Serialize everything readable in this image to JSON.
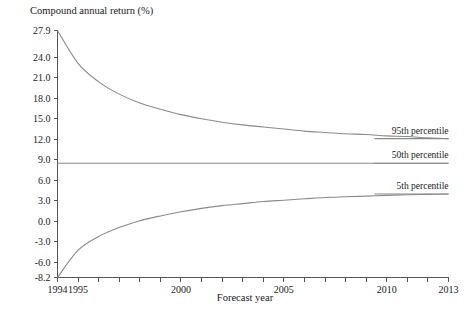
{
  "chart_data": {
    "type": "line",
    "title": "",
    "ylabel": "Compound annual return (%)",
    "xlabel": "Forecast year",
    "grid": false,
    "legend_position": "right-inline",
    "xlim": [
      1994,
      2013
    ],
    "ylim": [
      -8.2,
      27.9
    ],
    "x_tick_values": [
      1994,
      1995,
      1996,
      1997,
      1998,
      1999,
      2000,
      2001,
      2002,
      2003,
      2004,
      2005,
      2006,
      2007,
      2008,
      2009,
      2010,
      2011,
      2012,
      2013
    ],
    "x_tick_labels": [
      "1994",
      "1995",
      "",
      "",
      "",
      "",
      "2000",
      "",
      "",
      "",
      "",
      "2005",
      "",
      "",
      "",
      "",
      "2010",
      "",
      "",
      "2013"
    ],
    "y_tick_values": [
      27.9,
      24.0,
      21.0,
      18.0,
      15.0,
      12.0,
      9.0,
      6.0,
      3.0,
      0.0,
      -3.0,
      -6.0,
      -8.2
    ],
    "y_tick_labels": [
      "27.9",
      "24.0",
      "21.0",
      "18.0",
      "15.0",
      "12.0",
      "9.0",
      "6.0",
      "3.0",
      "0.0",
      "-3.0",
      "-6.0",
      "-8.2"
    ],
    "x": [
      1994,
      1995,
      1996,
      1997,
      1998,
      1999,
      2000,
      2001,
      2002,
      2003,
      2004,
      2005,
      2006,
      2007,
      2008,
      2009,
      2010,
      2011,
      2012,
      2013
    ],
    "series": [
      {
        "name": "95th percentile",
        "color": "#8a8a8a",
        "values": [
          27.9,
          23.1,
          20.4,
          18.6,
          17.3,
          16.4,
          15.6,
          15.0,
          14.5,
          14.1,
          13.8,
          13.5,
          13.2,
          13.0,
          12.8,
          12.7,
          12.5,
          12.4,
          12.2,
          12.1
        ]
      },
      {
        "name": "50th percentile",
        "color": "#8a8a8a",
        "values": [
          8.5,
          8.5,
          8.5,
          8.5,
          8.5,
          8.5,
          8.5,
          8.5,
          8.5,
          8.5,
          8.5,
          8.5,
          8.5,
          8.5,
          8.5,
          8.5,
          8.5,
          8.5,
          8.5,
          8.5
        ]
      },
      {
        "name": "5th percentile",
        "color": "#8a8a8a",
        "values": [
          -8.2,
          -4.2,
          -2.2,
          -0.9,
          0.1,
          0.8,
          1.4,
          1.9,
          2.3,
          2.6,
          2.9,
          3.1,
          3.3,
          3.5,
          3.6,
          3.7,
          3.8,
          3.9,
          3.95,
          4.0
        ]
      }
    ],
    "annotations": [
      {
        "text": "95th percentile",
        "value": 12.1,
        "year": 2013
      },
      {
        "text": "50th percentile",
        "value": 8.5,
        "year": 2013
      },
      {
        "text": "5th percentile",
        "value": 4.0,
        "year": 2013
      }
    ]
  }
}
